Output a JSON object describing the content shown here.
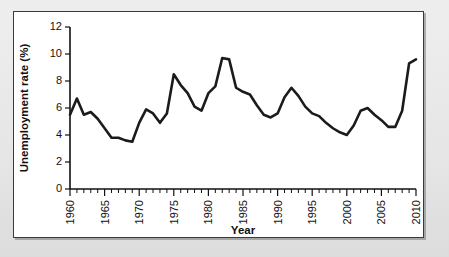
{
  "figure": {
    "background_color": "#e9e9e9",
    "card_color": "#ffffff",
    "border_color": "#3a3a3a",
    "line_color": "#1b1b1b"
  },
  "chart_data": {
    "type": "line",
    "title": "",
    "subtitle": "",
    "xlabel": "Year",
    "ylabel": "Unemployment rate (%)",
    "xlim": [
      1960,
      2010
    ],
    "ylim": [
      0,
      12
    ],
    "grid": false,
    "legend": false,
    "legend_position": "none",
    "y_ticks": [
      0,
      2,
      4,
      6,
      8,
      10,
      12
    ],
    "y_tick_labels": [
      "0",
      "2",
      "4",
      "6",
      "8",
      "10",
      "12"
    ],
    "x_ticks": [
      1960,
      1965,
      1970,
      1975,
      1980,
      1985,
      1990,
      1995,
      2000,
      2005,
      2010
    ],
    "x_tick_labels": [
      "1960",
      "1965",
      "1970",
      "1975",
      "1980",
      "1985",
      "1990",
      "1995",
      "2000",
      "2005",
      "2010"
    ],
    "x_minor_tick_step": 1,
    "series": [
      {
        "name": "Unemployment rate",
        "color": "#1b1b1b",
        "x": [
          1960,
          1961,
          1962,
          1963,
          1964,
          1965,
          1966,
          1967,
          1968,
          1969,
          1970,
          1971,
          1972,
          1973,
          1974,
          1975,
          1976,
          1977,
          1978,
          1979,
          1980,
          1981,
          1982,
          1983,
          1984,
          1985,
          1986,
          1987,
          1988,
          1989,
          1990,
          1991,
          1992,
          1993,
          1994,
          1995,
          1996,
          1997,
          1998,
          1999,
          2000,
          2001,
          2002,
          2003,
          2004,
          2005,
          2006,
          2007,
          2008,
          2009,
          2010
        ],
        "values": [
          5.5,
          6.7,
          5.5,
          5.7,
          5.2,
          4.5,
          3.8,
          3.8,
          3.6,
          3.5,
          4.9,
          5.9,
          5.6,
          4.9,
          5.6,
          8.5,
          7.7,
          7.1,
          6.1,
          5.8,
          7.1,
          7.6,
          9.7,
          9.6,
          7.5,
          7.2,
          7.0,
          6.2,
          5.5,
          5.3,
          5.6,
          6.8,
          7.5,
          6.9,
          6.1,
          5.6,
          5.4,
          4.9,
          4.5,
          4.2,
          4.0,
          4.7,
          5.8,
          6.0,
          5.5,
          5.1,
          4.6,
          4.6,
          5.8,
          9.3,
          9.6
        ]
      }
    ]
  }
}
